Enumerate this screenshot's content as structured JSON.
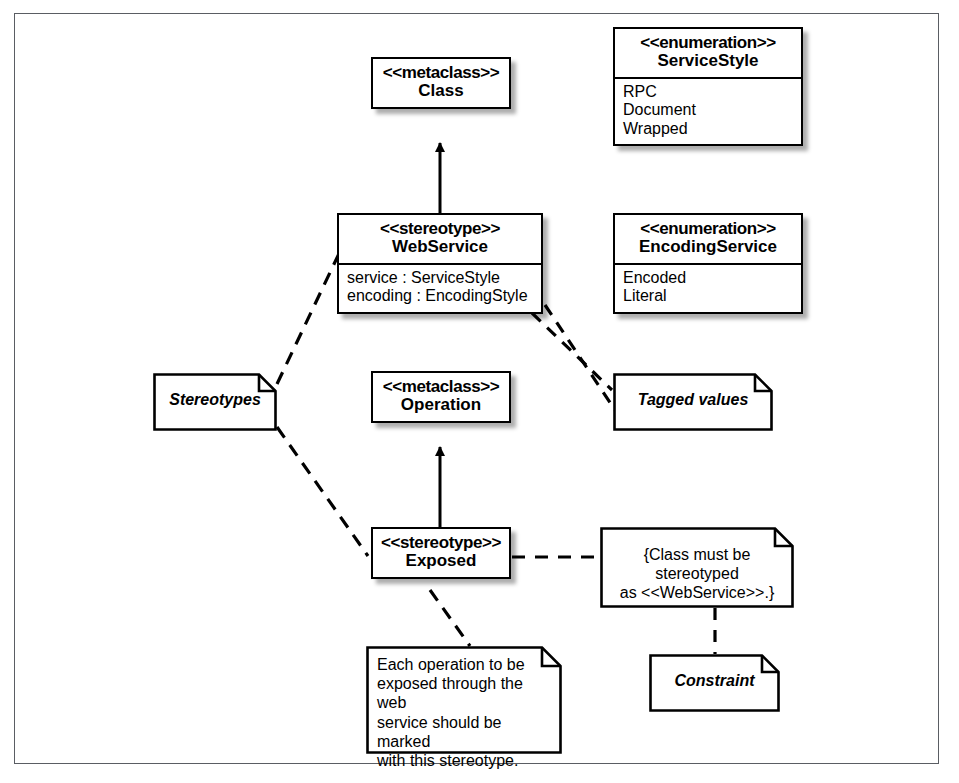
{
  "diagram": {
    "frame": {
      "border_color": "#5a5d63",
      "background": "#ffffff"
    }
  },
  "nodes": {
    "class_metaclass": {
      "stereotype": "<<metaclass>>",
      "name": "Class"
    },
    "service_style_enum": {
      "stereotype": "<<enumeration>>",
      "name": "ServiceStyle",
      "literals": [
        "RPC",
        "Document",
        "Wrapped"
      ]
    },
    "web_service_stereotype": {
      "stereotype": "<<stereotype>>",
      "name": "WebService",
      "attributes": [
        "service : ServiceStyle",
        "encoding : EncodingStyle"
      ]
    },
    "encoding_service_enum": {
      "stereotype": "<<enumeration>>",
      "name": "EncodingService",
      "literals": [
        "Encoded",
        "Literal"
      ]
    },
    "operation_metaclass": {
      "stereotype": "<<metaclass>>",
      "name": "Operation"
    },
    "exposed_stereotype": {
      "stereotype": "<<stereotype>>",
      "name": "Exposed"
    }
  },
  "notes": {
    "stereotypes_label": {
      "text": "Stereotypes"
    },
    "tagged_values_label": {
      "text": "Tagged values"
    },
    "constraint_label": {
      "text": "Constraint"
    },
    "constraint_body": {
      "lines": [
        "{Class must be stereotyped",
        "as <<WebService>>.}"
      ]
    },
    "exposed_description": {
      "lines": [
        "Each operation to be",
        "exposed through the web",
        "service should be marked",
        "with this stereotype."
      ]
    }
  },
  "connectors": [
    {
      "name": "webservice-extends-class",
      "style": "solid",
      "arrow": "filled-triangle"
    },
    {
      "name": "exposed-extends-operation",
      "style": "solid",
      "arrow": "filled-triangle"
    },
    {
      "name": "stereotypes-note-to-webservice",
      "style": "dashed",
      "arrow": "none"
    },
    {
      "name": "stereotypes-note-to-exposed",
      "style": "dashed",
      "arrow": "none"
    },
    {
      "name": "tagged-values-to-service-attribute",
      "style": "dashed",
      "arrow": "none"
    },
    {
      "name": "tagged-values-to-encoding-attribute",
      "style": "dashed",
      "arrow": "none"
    },
    {
      "name": "exposed-to-constraint-body",
      "style": "dashed",
      "arrow": "none"
    },
    {
      "name": "exposed-to-description-note",
      "style": "dashed",
      "arrow": "none"
    },
    {
      "name": "constraint-body-to-constraint-label",
      "style": "dashed",
      "arrow": "none"
    }
  ]
}
